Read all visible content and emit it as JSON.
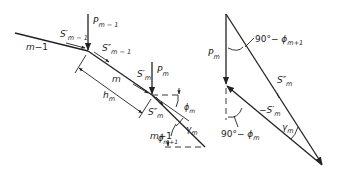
{
  "figure": {
    "left_diagram": {
      "members": [
        {
          "id": "m-1",
          "label": "m−1"
        },
        {
          "id": "m",
          "label": "m"
        },
        {
          "id": "m+1",
          "label": "m+1"
        }
      ],
      "loads": [
        {
          "symbol": "P",
          "subscript": "m−1"
        },
        {
          "symbol": "P",
          "subscript": "m"
        }
      ],
      "forces": [
        {
          "symbol": "S′",
          "subscript": "m−1"
        },
        {
          "symbol": "S″",
          "subscript": "m−1"
        },
        {
          "symbol": "S′",
          "subscript": "m"
        },
        {
          "symbol": "S″",
          "subscript": "m"
        }
      ],
      "dimension": {
        "symbol": "h",
        "subscript": "m"
      },
      "angles": [
        {
          "symbol": "ϕ",
          "subscript": "m"
        },
        {
          "symbol": "γ",
          "subscript": "m"
        },
        {
          "symbol": "ϕ",
          "subscript": "m+1"
        }
      ]
    },
    "right_diagram": {
      "vectors": [
        {
          "symbol": "P",
          "subscript": "m"
        },
        {
          "symbol": "S″",
          "subscript": "m"
        },
        {
          "symbol": "−S′",
          "subscript": "m"
        }
      ],
      "angles": [
        {
          "prefix": "90°−",
          "symbol": "ϕ",
          "subscript": "m+1"
        },
        {
          "prefix": "90°−",
          "symbol": "ϕ",
          "subscript": "m"
        },
        {
          "symbol": "γ",
          "subscript": "m"
        }
      ]
    }
  }
}
